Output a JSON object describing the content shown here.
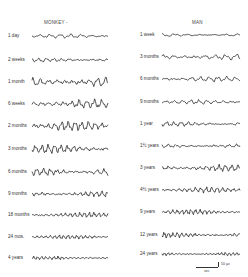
{
  "figure": {
    "left_panel": {
      "title": "MONKEY -",
      "rows": [
        {
          "label": "1 day",
          "y": 29,
          "amp": 2.2,
          "freq": 1.1,
          "seed": 1
        },
        {
          "label": "2 weeks",
          "y": 53,
          "amp": 2.2,
          "freq": 1.5,
          "seed": 2
        },
        {
          "label": "1 month",
          "y": 75,
          "amp": 5.5,
          "freq": 1.4,
          "seed": 3
        },
        {
          "label": "6 weeks",
          "y": 97,
          "amp": 5.0,
          "freq": 1.5,
          "seed": 4
        },
        {
          "label": "2 months",
          "y": 119,
          "amp": 5.5,
          "freq": 1.7,
          "seed": 5
        },
        {
          "label": "3 months",
          "y": 142,
          "amp": 5.0,
          "freq": 1.8,
          "seed": 6
        },
        {
          "label": "6 months",
          "y": 165,
          "amp": 4.5,
          "freq": 1.7,
          "seed": 7
        },
        {
          "label": "9 months",
          "y": 187,
          "amp": 3.2,
          "freq": 2.1,
          "seed": 8
        },
        {
          "label": "18 months",
          "y": 208,
          "amp": 3.0,
          "freq": 2.4,
          "seed": 9
        },
        {
          "label": "24 mos.",
          "y": 230,
          "amp": 2.4,
          "freq": 2.6,
          "seed": 10
        },
        {
          "label": "4 years",
          "y": 251,
          "amp": 2.0,
          "freq": 2.8,
          "seed": 11
        }
      ]
    },
    "right_panel": {
      "title": "MAN",
      "rows": [
        {
          "label": "1 week",
          "y": 28,
          "amp": 1.6,
          "freq": 0.9,
          "seed": 21
        },
        {
          "label": "3 months",
          "y": 50,
          "amp": 3.2,
          "freq": 1.1,
          "seed": 22
        },
        {
          "label": "6 months",
          "y": 72,
          "amp": 3.0,
          "freq": 1.3,
          "seed": 23
        },
        {
          "label": "9 months",
          "y": 95,
          "amp": 2.4,
          "freq": 1.4,
          "seed": 24
        },
        {
          "label": "1 year",
          "y": 117,
          "amp": 2.6,
          "freq": 1.6,
          "seed": 25
        },
        {
          "label": "1½ years",
          "y": 139,
          "amp": 2.2,
          "freq": 1.5,
          "seed": 26
        },
        {
          "label": "3 years",
          "y": 161,
          "amp": 3.8,
          "freq": 1.8,
          "seed": 27
        },
        {
          "label": "4½ years",
          "y": 183,
          "amp": 3.0,
          "freq": 2.1,
          "seed": 28
        },
        {
          "label": "9 years",
          "y": 205,
          "amp": 2.8,
          "freq": 2.5,
          "seed": 29
        },
        {
          "label": "12 years",
          "y": 228,
          "amp": 3.0,
          "freq": 2.6,
          "seed": 30
        },
        {
          "label": "24 years",
          "y": 247,
          "amp": 2.0,
          "freq": 3.0,
          "seed": 31
        }
      ]
    },
    "scale_bar": {
      "amplitude_label": "50 µv",
      "time_label": "sec"
    }
  }
}
